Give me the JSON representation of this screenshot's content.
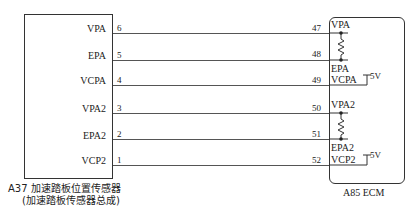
{
  "left_component": {
    "caption_line1": "A37 加速踏板位置传感器",
    "caption_line2": "(加速踏板传感器总成)",
    "pins": [
      {
        "label": "VPA",
        "num": "6"
      },
      {
        "label": "EPA",
        "num": "5"
      },
      {
        "label": "VCPA",
        "num": "4"
      },
      {
        "label": "VPA2",
        "num": "3"
      },
      {
        "label": "EPA2",
        "num": "2"
      },
      {
        "label": "VCP2",
        "num": "1"
      }
    ]
  },
  "right_component": {
    "caption": "A85 ECM",
    "pins": [
      {
        "label": "VPA",
        "num": "47"
      },
      {
        "label": "",
        "num": "48"
      },
      {
        "label": "VCPA",
        "num": "49"
      },
      {
        "label": "VPA2",
        "num": "50"
      },
      {
        "label": "",
        "num": "51"
      },
      {
        "label": "VCP2",
        "num": "52"
      }
    ],
    "inner_labels": {
      "epa": "EPA",
      "epa2": "EPA2"
    },
    "supply_1": "5V",
    "supply_2": "5V"
  }
}
